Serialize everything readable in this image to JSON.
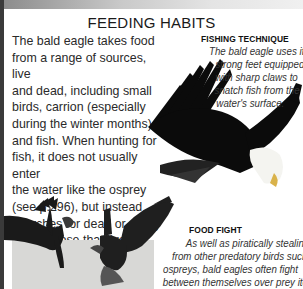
{
  "page": {
    "title": "FEEDING HABITS",
    "body_lines": [
      "The bald eagle takes food",
      "from a range of sources, live",
      "and dead, including small",
      "birds, carrion (especially",
      "during the winter months),",
      "and fish. When hunting for",
      "fish, it does not usually enter",
      "the water like the osprey",
      "(see p.296), but instead",
      "searches for dead or dying",
      "fish or those that live",
      "near the surface."
    ]
  },
  "captions": {
    "fishing": {
      "title": "FISHING TECHNIQUE",
      "lines": [
        "The bald eagle uses its",
        "strong feet equipped",
        "with sharp claws to",
        "snatch fish from the",
        "water's surface."
      ]
    },
    "fight": {
      "title": "FOOD FIGHT",
      "lines": [
        "As well as piratically stealing food",
        "from other predatory birds such as",
        "ospreys, bald eagles often fight",
        "between themselves over prey items."
      ]
    }
  },
  "images": {
    "diving_eagle": "bald-eagle-swooping-photo",
    "fighting_eagles": "two-bald-eagles-fighting-photo"
  }
}
